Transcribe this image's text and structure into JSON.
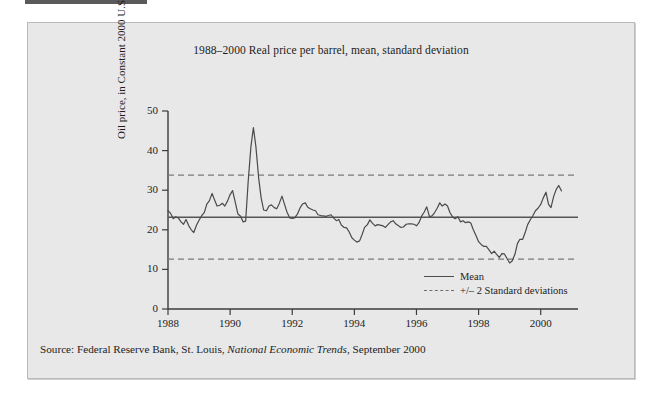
{
  "figure": {
    "title": "1988–2000 Real price per barrel, mean, standard deviation",
    "source_prefix": "Source: Federal Reserve Bank, St. Louis, ",
    "source_italic": "National Economic Trends",
    "source_suffix": ", September 2000"
  },
  "colors": {
    "panel_background": "#e8e8e8",
    "panel_border": "#b9b9b9",
    "axis": "#3c3c3c",
    "series_line": "#4a4a4a",
    "mean_line": "#555555",
    "band_line": "#7a7a7a",
    "text": "#1d1d1d"
  },
  "chart_data": {
    "type": "line",
    "title": "1988–2000 Real price per barrel, mean, standard deviation",
    "xlabel": "",
    "ylabel": "Oil price, in Constant 2000 U.S.$",
    "xlim": [
      1988.0,
      2000.75
    ],
    "ylim": [
      0,
      50
    ],
    "grid": false,
    "legend_position": "inside lower right",
    "xticks": [
      1988,
      1990,
      1992,
      1994,
      1996,
      1998,
      2000
    ],
    "xtick_labels": [
      "1988",
      "1990",
      "1992",
      "1994",
      "1996",
      "1998",
      "2000"
    ],
    "yticks": [
      0,
      10,
      20,
      30,
      40,
      50
    ],
    "ytick_labels": [
      "0",
      "10",
      "20",
      "30",
      "40",
      "50"
    ],
    "legend": [
      {
        "label": "Mean",
        "style": "solid"
      },
      {
        "label": "+/– 2 Standard deviations",
        "style": "dashed"
      }
    ],
    "reference_lines": [
      {
        "name": "mean",
        "value": 23.2,
        "style": "solid"
      },
      {
        "name": "plus_two_sd",
        "value": 33.8,
        "style": "dashed"
      },
      {
        "name": "minus_two_sd",
        "value": 12.6,
        "style": "dashed"
      }
    ],
    "statistics": {
      "mean": 23.2,
      "standard_deviation": 5.3
    },
    "series": [
      {
        "name": "Real oil price per barrel",
        "style": "solid",
        "x": [
          1988.0,
          1988.08,
          1988.17,
          1988.25,
          1988.33,
          1988.42,
          1988.5,
          1988.58,
          1988.67,
          1988.75,
          1988.83,
          1988.92,
          1989.0,
          1989.08,
          1989.17,
          1989.25,
          1989.33,
          1989.42,
          1989.5,
          1989.58,
          1989.67,
          1989.75,
          1989.83,
          1989.92,
          1990.0,
          1990.08,
          1990.17,
          1990.25,
          1990.33,
          1990.42,
          1990.5,
          1990.58,
          1990.67,
          1990.75,
          1990.83,
          1990.92,
          1991.0,
          1991.08,
          1991.17,
          1991.25,
          1991.33,
          1991.42,
          1991.5,
          1991.58,
          1991.67,
          1991.75,
          1991.83,
          1991.92,
          1992.0,
          1992.08,
          1992.17,
          1992.25,
          1992.33,
          1992.42,
          1992.5,
          1992.58,
          1992.67,
          1992.75,
          1992.83,
          1992.92,
          1993.0,
          1993.08,
          1993.17,
          1993.25,
          1993.33,
          1993.42,
          1993.5,
          1993.58,
          1993.67,
          1993.75,
          1993.83,
          1993.92,
          1994.0,
          1994.08,
          1994.17,
          1994.25,
          1994.33,
          1994.42,
          1994.5,
          1994.58,
          1994.67,
          1994.75,
          1994.83,
          1994.92,
          1995.0,
          1995.08,
          1995.17,
          1995.25,
          1995.33,
          1995.42,
          1995.5,
          1995.58,
          1995.67,
          1995.75,
          1995.83,
          1995.92,
          1996.0,
          1996.08,
          1996.17,
          1996.25,
          1996.33,
          1996.42,
          1996.5,
          1996.58,
          1996.67,
          1996.75,
          1996.83,
          1996.92,
          1997.0,
          1997.08,
          1997.17,
          1997.25,
          1997.33,
          1997.42,
          1997.5,
          1997.58,
          1997.67,
          1997.75,
          1997.83,
          1997.92,
          1998.0,
          1998.08,
          1998.17,
          1998.25,
          1998.33,
          1998.42,
          1998.5,
          1998.58,
          1998.67,
          1998.75,
          1998.83,
          1998.92,
          1999.0,
          1999.08,
          1999.17,
          1999.25,
          1999.33,
          1999.42,
          1999.5,
          1999.58,
          1999.67,
          1999.75,
          1999.83,
          1999.92,
          2000.0,
          2000.08,
          2000.17,
          2000.25,
          2000.33,
          2000.42,
          2000.5,
          2000.58,
          2000.67
        ],
        "y": [
          24.8,
          24.2,
          22.8,
          23.3,
          23.0,
          22.0,
          21.4,
          22.6,
          21.0,
          20.0,
          19.3,
          21.2,
          22.4,
          23.5,
          24.4,
          26.5,
          27.3,
          29.2,
          27.5,
          26.0,
          26.2,
          26.7,
          26.0,
          27.3,
          28.9,
          29.9,
          26.8,
          24.0,
          23.5,
          22.0,
          22.2,
          32.0,
          41.0,
          45.8,
          41.0,
          33.0,
          28.0,
          25.0,
          24.8,
          26.0,
          26.3,
          25.6,
          25.3,
          26.6,
          28.5,
          26.5,
          24.5,
          23.0,
          22.9,
          23.0,
          24.0,
          25.5,
          26.5,
          26.8,
          25.7,
          25.3,
          25.0,
          24.8,
          23.8,
          23.6,
          23.5,
          23.4,
          23.6,
          23.8,
          23.0,
          22.3,
          22.6,
          21.2,
          20.6,
          20.5,
          19.5,
          18.0,
          17.4,
          16.9,
          17.2,
          18.8,
          20.6,
          21.3,
          22.5,
          21.7,
          21.0,
          21.3,
          21.2,
          21.0,
          20.6,
          21.3,
          22.0,
          22.3,
          21.5,
          21.0,
          20.6,
          20.7,
          21.4,
          21.5,
          21.5,
          21.4,
          21.0,
          21.8,
          23.5,
          24.5,
          25.8,
          23.3,
          23.5,
          24.3,
          25.5,
          26.8,
          26.0,
          26.5,
          26.0,
          24.3,
          23.2,
          22.8,
          23.3,
          22.0,
          22.3,
          21.8,
          22.0,
          21.7,
          20.0,
          18.5,
          17.0,
          16.3,
          15.8,
          15.8,
          15.0,
          14.0,
          14.6,
          13.8,
          13.0,
          14.0,
          13.9,
          12.7,
          11.6,
          12.1,
          13.8,
          16.5,
          17.6,
          17.6,
          19.3,
          21.3,
          22.6,
          23.6,
          24.8,
          25.5,
          26.4,
          28.0,
          29.5,
          26.5,
          25.6,
          28.5,
          30.2,
          31.2,
          29.8
        ]
      }
    ]
  }
}
